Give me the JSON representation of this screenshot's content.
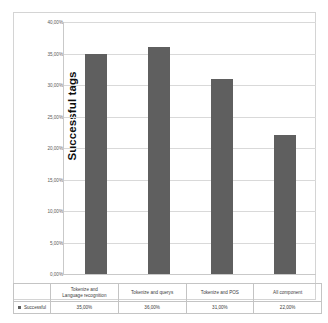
{
  "chart_data": {
    "type": "bar",
    "title": "",
    "subtitle": "",
    "xlabel": "",
    "ylabel": "Successful tags",
    "ylim": [
      0,
      40
    ],
    "ytick_labels": [
      "40,00%",
      "35,00%",
      "30,00%",
      "25,00%",
      "20,00%",
      "15,00%",
      "10,00%",
      "5,00%",
      "0,00%"
    ],
    "ytick_values": [
      40,
      35,
      30,
      25,
      20,
      15,
      10,
      5,
      0
    ],
    "grid": true,
    "legend_position": "bottom-left-table",
    "categories": [
      "Tokenize and Language recognition",
      "Tokenize and querys",
      "Tokenize and POS",
      "All component"
    ],
    "category_lines": [
      [
        "Tokenize and",
        "Language recognition"
      ],
      [
        "Tokenize and querys"
      ],
      [
        "Tokenize and POS"
      ],
      [
        "All component"
      ]
    ],
    "series": [
      {
        "name": "Successful",
        "values": [
          35,
          36,
          31,
          22
        ],
        "value_labels": [
          "35,00%",
          "36,00%",
          "31,00%",
          "22,00%"
        ],
        "color": "#5F5F5F"
      }
    ]
  },
  "colors": {
    "bar": "#5F5F5F",
    "gridline": "#D9D9D9",
    "axis": "#C9C9C9",
    "frame_border": "#D4D4D4",
    "table_border": "#C4C4C4",
    "text": "#3C3C3C",
    "axis_title": "#0D0D0D",
    "background": "#FFFFFF"
  },
  "legend": {
    "marker_icon": "square-marker-icon",
    "label": "Successful"
  }
}
